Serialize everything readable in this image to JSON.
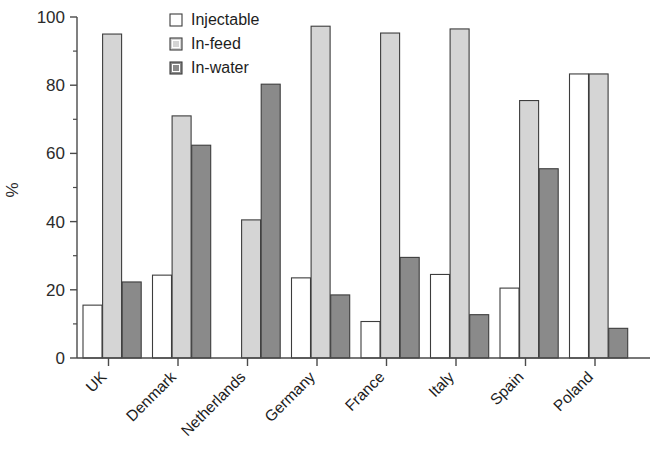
{
  "chart_data": {
    "type": "bar",
    "title": "",
    "subtitle": "",
    "xlabel": "",
    "ylabel": "%",
    "ylim": [
      0,
      100
    ],
    "yticks": [
      0,
      20,
      40,
      60,
      80,
      100
    ],
    "ytick_labels": [
      "0",
      "20",
      "40",
      "60",
      "80",
      "100"
    ],
    "yminor_ticks": [
      10,
      30,
      50,
      70,
      90
    ],
    "grid": false,
    "legend_position": "top-center",
    "categories": [
      "UK",
      "Denmark",
      "Netherlands",
      "Germany",
      "France",
      "Italy",
      "Spain",
      "Poland"
    ],
    "series": [
      {
        "name": "Injectable",
        "color": "#ffffff",
        "values": [
          15.5,
          24.3,
          0,
          23.5,
          10.7,
          24.5,
          20.5,
          83.3
        ]
      },
      {
        "name": "In-feed",
        "color": "#d5d5d5",
        "values": [
          95.0,
          71.0,
          40.5,
          97.3,
          95.3,
          96.5,
          75.5,
          83.3
        ]
      },
      {
        "name": "In-water",
        "color": "#8a8a8a",
        "values": [
          22.3,
          62.4,
          80.3,
          18.5,
          29.5,
          12.7,
          55.5,
          8.7
        ]
      }
    ]
  },
  "legend": {
    "items": [
      {
        "label": "Injectable",
        "color": "#ffffff"
      },
      {
        "label": "In-feed",
        "color": "#d5d5d5"
      },
      {
        "label": "In-water",
        "color": "#8a8a8a"
      }
    ]
  },
  "axes": {
    "y_title": "%",
    "bar_edge_color": "#3d3d3d",
    "axis_color": "#4a4a4a"
  }
}
